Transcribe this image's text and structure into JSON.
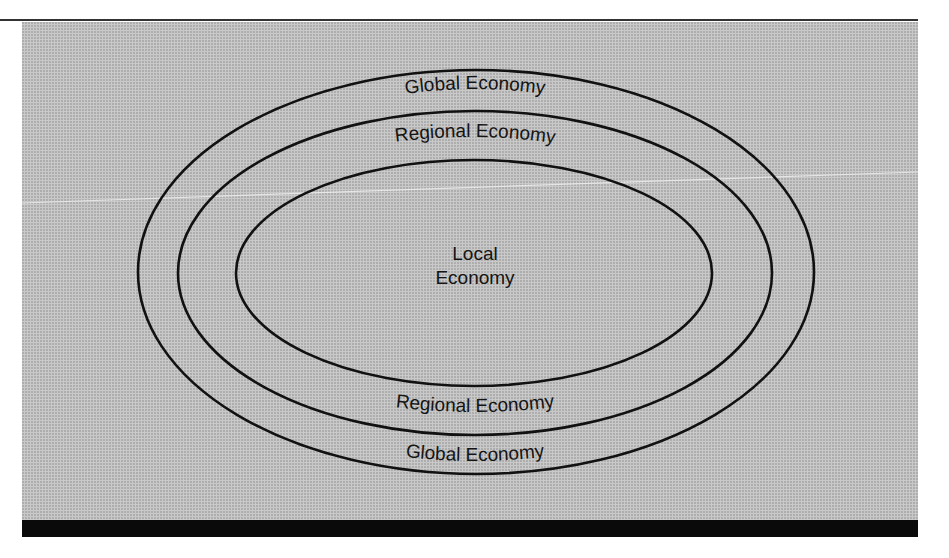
{
  "diagram": {
    "type": "nested-ellipses",
    "colors": {
      "background": "#c9c9c9",
      "stroke": "#111111",
      "bar": "#0a0a0a"
    },
    "rings": [
      {
        "id": "global",
        "top_label": "Global Economy",
        "bottom_label": "Global Economy"
      },
      {
        "id": "regional",
        "top_label": "Regional Economy",
        "bottom_label": "Regional Economy"
      },
      {
        "id": "local",
        "center_label_line1": "Local",
        "center_label_line2": "Economy"
      }
    ]
  }
}
